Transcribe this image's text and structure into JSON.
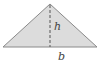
{
  "diagram": {
    "type": "triangle",
    "labels": {
      "height": "h",
      "base": "b"
    },
    "colors": {
      "fill": "#dcdcdc",
      "stroke": "#8a8a8a",
      "text": "#444444"
    }
  }
}
